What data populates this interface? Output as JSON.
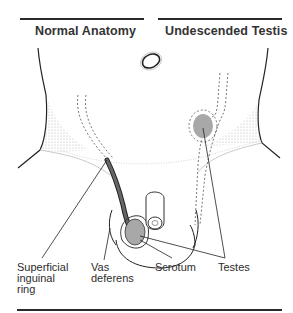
{
  "headings": {
    "left": "Normal Anatomy",
    "right": "Undescended Testis"
  },
  "labels": {
    "superficial_inguinal_ring": [
      "Superficial",
      "inguinal",
      "ring"
    ],
    "vas_deferens": [
      "Vas",
      "deferens"
    ],
    "scrotum": "Scrotum",
    "testes": "Testes"
  },
  "colors": {
    "line": "#2a2a2a",
    "testis_fill": "#a8a8a8",
    "vas_fill": "#555555",
    "stipple": "#9a9a9a"
  }
}
